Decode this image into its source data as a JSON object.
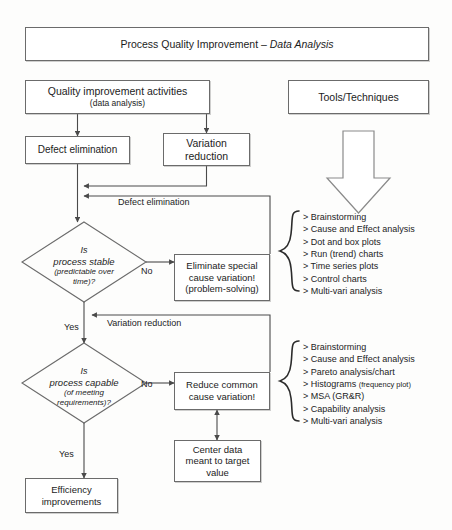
{
  "title": {
    "prefix": "Process Quality Improvement – ",
    "emphasis": "Data Analysis"
  },
  "nodes": {
    "activities": {
      "line1": "Quality improvement activities",
      "line2": "(data analysis)"
    },
    "tools_header": "Tools/Techniques",
    "defect_elimination": "Defect elimination",
    "variation_reduction_l1": "Variation",
    "variation_reduction_l2": "reduction",
    "eliminate_special_l1": "Eliminate special",
    "eliminate_special_l2": "cause variation!",
    "eliminate_special_l3": "(problem-solving)",
    "reduce_common_l1": "Reduce common",
    "reduce_common_l2": "cause variation!",
    "center_data_l1": "Center data",
    "center_data_l2": "meant to target",
    "center_data_l3": "value",
    "efficiency_l1": "Efficiency",
    "efficiency_l2": "improvements"
  },
  "decisions": {
    "stable": {
      "l1": "Is",
      "l2": "process stable",
      "l3": "(predictable over",
      "l4": "time)?"
    },
    "capable": {
      "l1": "Is",
      "l2": "process capable",
      "l3": "(of meeting",
      "l4": "requirements)?"
    }
  },
  "edge_labels": {
    "defect_elimination": "Defect elimination",
    "variation_reduction": "Variation reduction",
    "no_1": "No",
    "no_2": "No",
    "yes_1": "Yes",
    "yes_2": "Yes"
  },
  "tools_lists": [
    {
      "items": [
        {
          "text": "> Brainstorming"
        },
        {
          "text": "> Cause and Effect analysis"
        },
        {
          "text": "> Dot and box plots"
        },
        {
          "text": "> Run (trend) charts"
        },
        {
          "text": "> Time series plots"
        },
        {
          "text": "> Control charts"
        },
        {
          "text": "> Multi-vari analysis"
        }
      ]
    },
    {
      "items": [
        {
          "text": "> Brainstorming"
        },
        {
          "text": "> Cause and Effect analysis"
        },
        {
          "text": "> Pareto analysis/chart"
        },
        {
          "text": "> Histograms ",
          "small": "(frequency plot)"
        },
        {
          "text": "> MSA (GR&R)"
        },
        {
          "text": "> Capability analysis"
        },
        {
          "text": "> Multi-vari analysis"
        }
      ]
    }
  ],
  "icons": {
    "big_arrow": "down-block-arrow-icon",
    "brace_1": "left-brace-icon",
    "brace_2": "left-brace-icon"
  },
  "colors": {
    "stroke": "#6b6b6b",
    "line": "#4a4a4a",
    "text": "#1c1c1c",
    "background": "#fdfdfc"
  }
}
